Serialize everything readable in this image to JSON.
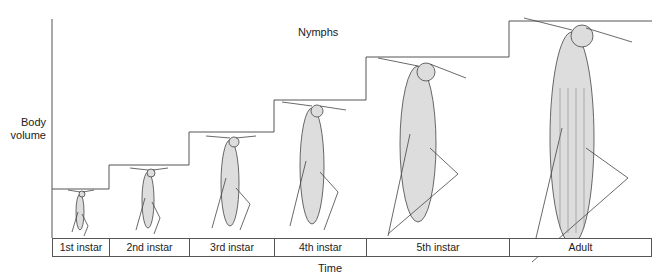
{
  "diagram": {
    "title": "Nymphs",
    "y_axis_label": "Body volume",
    "x_axis_label": "Time",
    "stages": [
      {
        "label": "1st instar",
        "x0": 52,
        "x1": 109,
        "step_top": 189,
        "insect_scale": 0.25
      },
      {
        "label": "2nd instar",
        "x0": 109,
        "x1": 189,
        "step_top": 165,
        "insect_scale": 0.35
      },
      {
        "label": "3rd instar",
        "x0": 189,
        "x1": 274,
        "step_top": 132,
        "insect_scale": 0.5
      },
      {
        "label": "4th instar",
        "x0": 274,
        "x1": 366,
        "step_top": 100,
        "insect_scale": 0.65
      },
      {
        "label": "5th instar",
        "x0": 366,
        "x1": 509,
        "step_top": 57,
        "insect_scale": 0.85
      },
      {
        "label": "Adult",
        "x0": 509,
        "x1": 652,
        "step_top": 21,
        "insect_scale": 1.0
      }
    ],
    "line_color": "#555555"
  }
}
